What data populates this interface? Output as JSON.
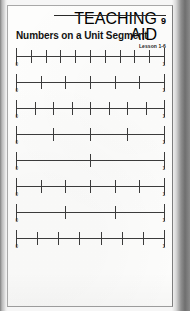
{
  "header": {
    "teaching_aid_label": "TEACHING AID",
    "teaching_aid_number": "9",
    "lesson_label": "Lesson 1-6"
  },
  "title": "Numbers on a Unit Segment",
  "number_lines": {
    "start_label": "0",
    "end_label": "1",
    "lines": [
      {
        "name": "number-line-tenths",
        "divisions": 10
      },
      {
        "name": "number-line-sixths",
        "divisions": 6
      },
      {
        "name": "number-line-eighths",
        "divisions": 8
      },
      {
        "name": "number-line-fourths",
        "divisions": 4
      },
      {
        "name": "number-line-halves",
        "divisions": 2
      },
      {
        "name": "number-line-sixths-2",
        "divisions": 6
      },
      {
        "name": "number-line-thirds",
        "divisions": 3
      },
      {
        "name": "number-line-sevenths",
        "divisions": 7
      }
    ]
  },
  "colors": {
    "ink": "#3c3c3c",
    "heading_ink": "#111111",
    "paper": "#fdfdfc",
    "scan_surround": "#8e8e8e"
  }
}
